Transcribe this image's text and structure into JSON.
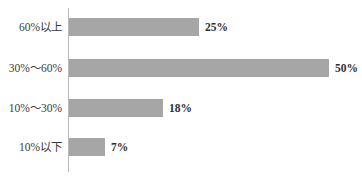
{
  "chart_data": {
    "type": "bar",
    "orientation": "horizontal",
    "title": "",
    "subtitle": "",
    "xlabel": "",
    "ylabel": "",
    "categories": [
      "60%以上",
      "30%～60%",
      "10%～30%",
      "10%以下"
    ],
    "values": [
      25,
      50,
      18,
      7
    ],
    "value_labels": [
      "25%",
      "50%",
      "18%",
      "7%"
    ],
    "value_unit": "%",
    "xlim": [
      0,
      50
    ],
    "ylim": null,
    "grid": false,
    "legend": null,
    "legend_position": "none",
    "annotations": [],
    "series": [
      {
        "name": "",
        "values": [
          25,
          50,
          18,
          7
        ]
      }
    ]
  },
  "style": {
    "bar_color": "#a6a6a6",
    "axis_color": "#b9b9b9",
    "background": "#ffffff",
    "label_color": "#3a3a3a",
    "value_color": "#303030"
  }
}
